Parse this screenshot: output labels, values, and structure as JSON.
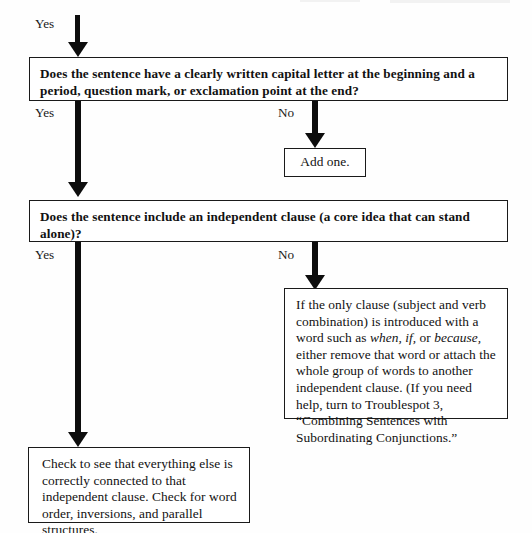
{
  "flowchart": {
    "title": "Sentence troubleshooting flowchart",
    "background_color": "#fefefe",
    "line_color": "#0d0d0d",
    "nodes": {
      "question_1": {
        "type": "decision",
        "text": "Does the sentence have a clearly written capital letter at the beginning and a period, question mark, or exclamation point at the end?"
      },
      "question_2": {
        "type": "decision",
        "text": "Does the sentence include an independent clause (a core idea that can stand alone)?"
      },
      "action_add_one": {
        "type": "action",
        "text": "Add one."
      },
      "action_subordinating": {
        "type": "action",
        "text_part_1": "If the only clause (subject and verb combination) is introduced with a word such as ",
        "italic_1": "when,",
        "text_part_2": " ",
        "italic_2": "if,",
        "text_part_3": " or ",
        "italic_3": "because,",
        "text_part_4": " either remove that word or attach the whole group of words to another independent clause. (If you need help, turn to Troublespot 3, “Combining Sentences with Subordinating Conjunctions.”"
      },
      "action_check": {
        "type": "action",
        "text": "Check to see that everything else is correctly connected to that independent clause. Check for word order, inversions, and parallel structures."
      }
    },
    "branch_labels": {
      "entry_yes": "Yes",
      "q1_yes": "Yes",
      "q1_no": "No",
      "q2_yes": "Yes",
      "q2_no": "No"
    }
  }
}
